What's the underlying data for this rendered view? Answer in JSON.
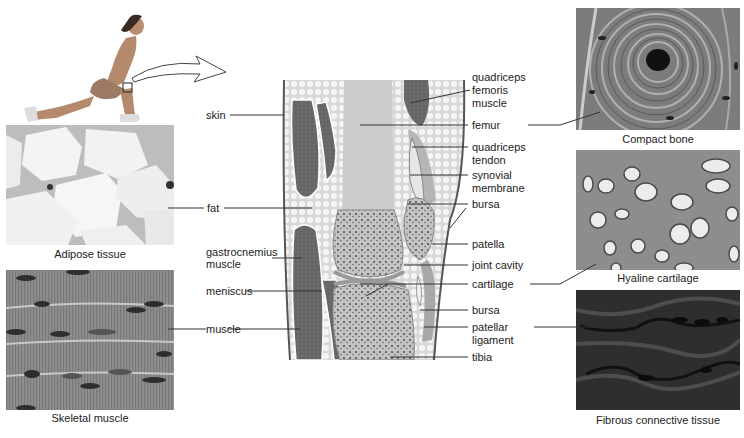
{
  "figure": {
    "panels": [
      {
        "id": "adipose",
        "caption": "Adipose tissue"
      },
      {
        "id": "skeletal",
        "caption": "Skeletal muscle"
      },
      {
        "id": "compact",
        "caption": "Compact bone"
      },
      {
        "id": "hyaline",
        "caption": "Hyaline cartilage"
      },
      {
        "id": "fibrous",
        "caption": "Fibrous connective tissue"
      }
    ],
    "left_labels": {
      "skin": "skin",
      "fat": "fat",
      "gastrocnemius_1": "gastrocnemius",
      "gastrocnemius_2": "muscle",
      "meniscus": "meniscus",
      "muscle": "muscle"
    },
    "right_labels": {
      "quad_1": "quadriceps",
      "quad_2": "femoris",
      "quad_3": "muscle",
      "femur": "femur",
      "quad_tendon_1": "quadriceps",
      "quad_tendon_2": "tendon",
      "synovial_1": "synovial",
      "synovial_2": "membrane",
      "bursa_upper": "bursa",
      "patella": "patella",
      "joint_cavity": "joint cavity",
      "cartilage": "cartilage",
      "bursa_lower": "bursa",
      "patellar_lig_1": "patellar",
      "patellar_lig_2": "ligament",
      "tibia": "tibia"
    },
    "colors": {
      "line": "#333333",
      "bone": "#c9c9c9",
      "muscle": "#6e6e6e",
      "fat": "#eeeeee"
    }
  }
}
